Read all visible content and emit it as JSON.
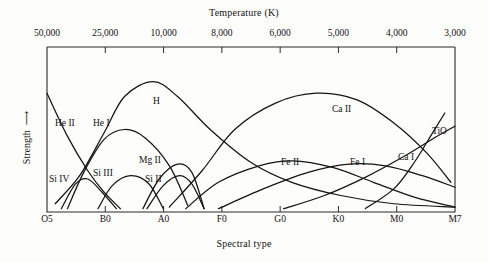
{
  "chart_data": {
    "type": "line",
    "title": "",
    "xlabel": "Spectral type",
    "ylabel": "Strength",
    "top_axis_label": "Temperature (K)",
    "grid": false,
    "legend": "inline-curve-labels",
    "x_top_ticks": [
      "50,000",
      "25,000",
      "10,000",
      "8,000",
      "6,000",
      "5,000",
      "4,000",
      "3,000"
    ],
    "x_bottom_ticks": [
      "O5",
      "B0",
      "A0",
      "F0",
      "G0",
      "K0",
      "M0",
      "M7"
    ],
    "ylim": [
      0,
      1
    ],
    "series": [
      {
        "name": "He II",
        "label": "He II",
        "description": "Declines steeply from upper left; strongest at hottest O stars",
        "points": [
          [
            0.0,
            0.72
          ],
          [
            0.05,
            0.46
          ],
          [
            0.1,
            0.25
          ],
          [
            0.14,
            0.12
          ],
          [
            0.18,
            0.02
          ]
        ]
      },
      {
        "name": "He I",
        "label": "He I",
        "description": "Broad hump peaking near B2",
        "points": [
          [
            0.05,
            0.02
          ],
          [
            0.09,
            0.24
          ],
          [
            0.14,
            0.44
          ],
          [
            0.19,
            0.5
          ],
          [
            0.24,
            0.45
          ],
          [
            0.3,
            0.28
          ],
          [
            0.345,
            0.04
          ]
        ]
      },
      {
        "name": "Si IV",
        "label": "Si IV",
        "description": "Small low hump near O9-B0",
        "points": [
          [
            0.035,
            0.02
          ],
          [
            0.07,
            0.17
          ],
          [
            0.1,
            0.2
          ],
          [
            0.135,
            0.12
          ],
          [
            0.17,
            0.02
          ]
        ]
      },
      {
        "name": "Si III",
        "label": "Si III",
        "description": "Low hump peaking near B2",
        "points": [
          [
            0.125,
            0.02
          ],
          [
            0.16,
            0.16
          ],
          [
            0.205,
            0.22
          ],
          [
            0.25,
            0.17
          ],
          [
            0.285,
            0.02
          ]
        ]
      },
      {
        "name": "Si II",
        "label": "Si II",
        "description": "Low hump peaking near A0",
        "points": [
          [
            0.245,
            0.02
          ],
          [
            0.285,
            0.16
          ],
          [
            0.325,
            0.22
          ],
          [
            0.355,
            0.17
          ],
          [
            0.385,
            0.02
          ]
        ]
      },
      {
        "name": "Mg II",
        "label": "Mg II",
        "description": "Hump peaking near A2, slightly higher than Si II",
        "points": [
          [
            0.235,
            0.02
          ],
          [
            0.275,
            0.2
          ],
          [
            0.32,
            0.29
          ],
          [
            0.355,
            0.24
          ],
          [
            0.385,
            0.02
          ]
        ]
      },
      {
        "name": "H",
        "label": "H",
        "description": "Balmer lines, strong broad peak at A0",
        "points": [
          [
            0.02,
            0.05
          ],
          [
            0.08,
            0.22
          ],
          [
            0.14,
            0.48
          ],
          [
            0.19,
            0.7
          ],
          [
            0.26,
            0.79
          ],
          [
            0.32,
            0.7
          ],
          [
            0.4,
            0.5
          ],
          [
            0.5,
            0.3
          ],
          [
            0.6,
            0.18
          ],
          [
            0.72,
            0.1
          ],
          [
            0.85,
            0.05
          ],
          [
            1.0,
            0.03
          ]
        ]
      },
      {
        "name": "Ca II",
        "label": "Ca II",
        "description": "Very broad strong maximum near K0",
        "points": [
          [
            0.3,
            0.03
          ],
          [
            0.38,
            0.25
          ],
          [
            0.46,
            0.5
          ],
          [
            0.56,
            0.66
          ],
          [
            0.66,
            0.72
          ],
          [
            0.76,
            0.68
          ],
          [
            0.85,
            0.54
          ],
          [
            0.93,
            0.36
          ],
          [
            0.99,
            0.18
          ]
        ]
      },
      {
        "name": "Fe II",
        "label": "Fe II",
        "description": "Broad low hump peaking near G0",
        "points": [
          [
            0.34,
            0.02
          ],
          [
            0.42,
            0.18
          ],
          [
            0.52,
            0.28
          ],
          [
            0.6,
            0.31
          ],
          [
            0.7,
            0.27
          ],
          [
            0.8,
            0.18
          ],
          [
            0.9,
            0.09
          ],
          [
            1.0,
            0.03
          ]
        ]
      },
      {
        "name": "Fe I",
        "label": "Fe I",
        "description": "Broad low hump peaking near K0-K5",
        "points": [
          [
            0.42,
            0.02
          ],
          [
            0.53,
            0.14
          ],
          [
            0.64,
            0.24
          ],
          [
            0.74,
            0.29
          ],
          [
            0.83,
            0.28
          ],
          [
            0.92,
            0.22
          ],
          [
            1.0,
            0.15
          ]
        ]
      },
      {
        "name": "Ca I",
        "label": "Ca I",
        "description": "Rises steadily through late K into M",
        "points": [
          [
            0.58,
            0.02
          ],
          [
            0.68,
            0.1
          ],
          [
            0.78,
            0.21
          ],
          [
            0.87,
            0.33
          ],
          [
            0.95,
            0.45
          ],
          [
            1.0,
            0.52
          ]
        ]
      },
      {
        "name": "TiO",
        "label": "TiO",
        "description": "Rises very steeply in M stars",
        "points": [
          [
            0.78,
            0.02
          ],
          [
            0.85,
            0.14
          ],
          [
            0.9,
            0.3
          ],
          [
            0.945,
            0.48
          ],
          [
            0.975,
            0.6
          ]
        ]
      }
    ],
    "curve_labels": [
      {
        "name": "He II",
        "x": 55,
        "y": 118
      },
      {
        "name": "He I",
        "x": 93,
        "y": 118
      },
      {
        "name": "Si IV",
        "x": 49,
        "y": 174
      },
      {
        "name": "Si III",
        "x": 93,
        "y": 168
      },
      {
        "name": "Si II",
        "x": 145,
        "y": 174
      },
      {
        "name": "Mg II",
        "x": 139,
        "y": 155
      },
      {
        "name": "H",
        "x": 153,
        "y": 96
      },
      {
        "name": "Ca II",
        "x": 332,
        "y": 104
      },
      {
        "name": "Fe II",
        "x": 281,
        "y": 157
      },
      {
        "name": "Fe I",
        "x": 350,
        "y": 157
      },
      {
        "name": "Ca I",
        "x": 398,
        "y": 152
      },
      {
        "name": "TiO",
        "x": 432,
        "y": 126
      }
    ]
  }
}
